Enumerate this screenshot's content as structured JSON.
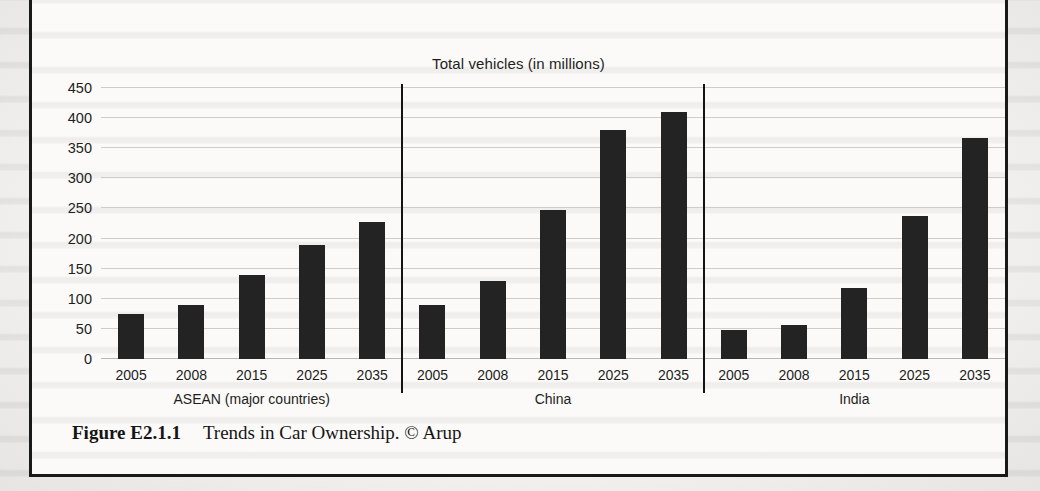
{
  "figure": {
    "caption_label": "Figure E2.1.1",
    "caption_text": "Trends in Car Ownership. © Arup"
  },
  "chart_data": {
    "type": "bar",
    "title": "Total vehicles (in millions)",
    "xlabel": "",
    "ylabel": "",
    "ylim": [
      0,
      450
    ],
    "yticks": [
      0,
      50,
      100,
      150,
      200,
      250,
      300,
      350,
      400,
      450
    ],
    "ytick_labels": [
      "0",
      "50",
      "100",
      "150",
      "200",
      "250",
      "300",
      "350",
      "400",
      "450"
    ],
    "grid": true,
    "legend": "none",
    "categories": [
      "2005",
      "2008",
      "2015",
      "2025",
      "2035"
    ],
    "groups": [
      {
        "name": "ASEAN (major countries)",
        "categories": [
          "2005",
          "2008",
          "2015",
          "2025",
          "2035"
        ],
        "values": [
          75,
          90,
          140,
          189,
          228
        ]
      },
      {
        "name": "China",
        "categories": [
          "2005",
          "2008",
          "2015",
          "2025",
          "2035"
        ],
        "values": [
          90,
          129,
          248,
          380,
          410
        ]
      },
      {
        "name": "India",
        "categories": [
          "2005",
          "2008",
          "2015",
          "2025",
          "2035"
        ],
        "values": [
          48,
          57,
          118,
          237,
          367
        ]
      }
    ],
    "colors": {
      "bar": "#232323",
      "grid": "#cfcdc9",
      "divider": "#141414",
      "text": "#1e1e1e",
      "plot_background": "#fbfaf8"
    }
  }
}
